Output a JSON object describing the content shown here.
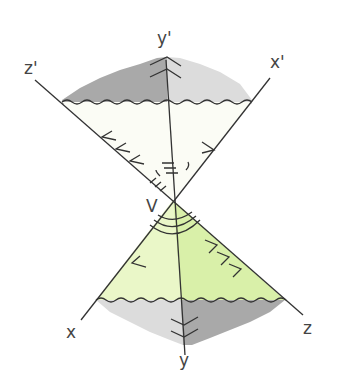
{
  "labels": {
    "y_prime": "y'",
    "z_prime": "z'",
    "x_prime": "x'",
    "vertex": "V",
    "x": "x",
    "y": "y",
    "z": "z"
  },
  "colors": {
    "upper_fill": "#fbfcf5",
    "lower_fill_left": "#eaf7c8",
    "lower_fill_right": "#d9f0a9",
    "dark_gray": "#a9a9a9",
    "light_gray": "#dcdcdc"
  }
}
